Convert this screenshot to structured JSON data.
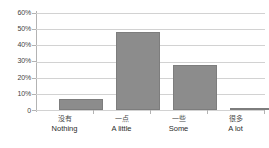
{
  "chart_data": {
    "type": "bar",
    "title": "",
    "subtitle": "",
    "xlabel": "",
    "ylabel": "",
    "ylim": [
      0,
      60
    ],
    "ytick_values": [
      0,
      10,
      20,
      30,
      40,
      50,
      60
    ],
    "ytick_labels": [
      "0",
      "10%",
      "20%",
      "30%",
      "40%",
      "50%",
      "60%"
    ],
    "grid": true,
    "legend": false,
    "legend_position": "none",
    "bar_color": "#8c8c8c",
    "gridline_color": "#d2d2d2",
    "axis_color": "#b3b3b3",
    "background_color": "#ffffff",
    "categories": [
      "没有",
      "一点",
      "一些",
      "很多"
    ],
    "categories_en": [
      "Nothing",
      "A little",
      "Some",
      "A lot"
    ],
    "values": [
      7,
      48,
      28,
      1.5
    ],
    "points": [
      {
        "zh": "没有",
        "en": "Nothing",
        "value": 7
      },
      {
        "zh": "一点",
        "en": "A little",
        "value": 48
      },
      {
        "zh": "一些",
        "en": "Some",
        "value": 28
      },
      {
        "zh": "很多",
        "en": "A lot",
        "value": 1.5
      }
    ]
  }
}
